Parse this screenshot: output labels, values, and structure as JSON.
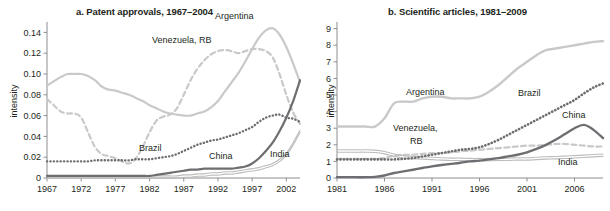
{
  "figure": {
    "background": "#ffffff",
    "text_color": "#231f20"
  },
  "colors": {
    "argentina": "#c9c9c9",
    "venezuela": "#c9c9c9",
    "brazil": "#6d6e71",
    "china": "#6d6e71",
    "india": "#bcbcbc",
    "axis": "#808285"
  },
  "panel_a": {
    "title": "a. Patent approvals, 1967–2004",
    "ylabel": "intensity",
    "ytick_labels": [
      "0",
      "0.02",
      "0.04",
      "0.06",
      "0.08",
      "0.10",
      "0.12",
      "0.14"
    ],
    "xtick_labels": [
      "1967",
      "1972",
      "1977",
      "1982",
      "1987",
      "1992",
      "1997",
      "2002"
    ],
    "series_labels": {
      "argentina": "Argentina",
      "venezuela": "Venezuela, RB",
      "brazil": "Brazil",
      "china": "China",
      "india": "India"
    }
  },
  "panel_b": {
    "title": "b. Scientific articles, 1981–2009",
    "ylabel": "intensity",
    "ytick_labels": [
      "0",
      "1",
      "2",
      "3",
      "4",
      "5",
      "6",
      "7",
      "8",
      "9"
    ],
    "xtick_labels": [
      "1981",
      "1986",
      "1991",
      "1996",
      "2001",
      "2006"
    ],
    "series_labels": {
      "argentina": "Argentina",
      "venezuela_line1": "Venezuela,",
      "venezuela_line2": "RB",
      "brazil": "Brazil",
      "china": "China",
      "india": "India"
    }
  },
  "chart_data": [
    {
      "type": "line",
      "title": "a. Patent approvals, 1967–2004",
      "xlabel": "",
      "ylabel": "intensity",
      "xlim": [
        1967,
        2004
      ],
      "ylim": [
        0,
        0.15
      ],
      "yticks": [
        0,
        0.02,
        0.04,
        0.06,
        0.08,
        0.1,
        0.12,
        0.14
      ],
      "xticks": [
        1967,
        1972,
        1977,
        1982,
        1987,
        1992,
        1997,
        2002
      ],
      "grid": false,
      "legend": "inline-annotations",
      "x": [
        1967,
        1968,
        1969,
        1970,
        1971,
        1972,
        1973,
        1974,
        1975,
        1976,
        1977,
        1978,
        1979,
        1980,
        1981,
        1982,
        1983,
        1984,
        1985,
        1986,
        1987,
        1988,
        1989,
        1990,
        1991,
        1992,
        1993,
        1994,
        1995,
        1996,
        1997,
        1998,
        1999,
        2000,
        2001,
        2002,
        2003,
        2004
      ],
      "series": [
        {
          "name": "Argentina",
          "style": "solid",
          "color": "#c9c9c9",
          "width": 2.2,
          "values": [
            0.089,
            0.093,
            0.097,
            0.1,
            0.1,
            0.1,
            0.098,
            0.094,
            0.088,
            0.085,
            0.084,
            0.082,
            0.08,
            0.077,
            0.074,
            0.07,
            0.067,
            0.064,
            0.062,
            0.061,
            0.06,
            0.06,
            0.062,
            0.064,
            0.068,
            0.074,
            0.083,
            0.092,
            0.101,
            0.112,
            0.124,
            0.135,
            0.142,
            0.144,
            0.138,
            0.126,
            0.11,
            0.092
          ]
        },
        {
          "name": "Venezuela, RB",
          "style": "dashed",
          "color": "#c9c9c9",
          "width": 2.2,
          "values": [
            0.076,
            0.07,
            0.064,
            0.062,
            0.062,
            0.058,
            0.044,
            0.03,
            0.023,
            0.021,
            0.019,
            0.016,
            0.014,
            0.019,
            0.03,
            0.044,
            0.055,
            0.059,
            0.061,
            0.067,
            0.08,
            0.094,
            0.105,
            0.113,
            0.119,
            0.122,
            0.123,
            0.122,
            0.12,
            0.122,
            0.124,
            0.124,
            0.122,
            0.116,
            0.1,
            0.08,
            0.063,
            0.052
          ]
        },
        {
          "name": "Brazil",
          "style": "dotted",
          "color": "#6d6e71",
          "width": 2.4,
          "values": [
            0.016,
            0.016,
            0.016,
            0.016,
            0.016,
            0.016,
            0.016,
            0.017,
            0.017,
            0.017,
            0.017,
            0.017,
            0.017,
            0.018,
            0.018,
            0.018,
            0.019,
            0.02,
            0.021,
            0.023,
            0.026,
            0.029,
            0.032,
            0.034,
            0.036,
            0.037,
            0.039,
            0.041,
            0.043,
            0.046,
            0.049,
            0.054,
            0.058,
            0.06,
            0.061,
            0.058,
            0.057,
            0.054
          ]
        },
        {
          "name": "China",
          "style": "solid",
          "color": "#6d6e71",
          "width": 2.2,
          "values": [
            0.002,
            0.002,
            0.002,
            0.002,
            0.002,
            0.002,
            0.002,
            0.002,
            0.002,
            0.002,
            0.002,
            0.002,
            0.002,
            0.002,
            0.002,
            0.002,
            0.003,
            0.004,
            0.005,
            0.006,
            0.007,
            0.008,
            0.008,
            0.009,
            0.009,
            0.009,
            0.009,
            0.009,
            0.01,
            0.011,
            0.014,
            0.019,
            0.026,
            0.034,
            0.045,
            0.058,
            0.074,
            0.094
          ]
        },
        {
          "name": "India",
          "style": "solid-thin-double",
          "color": "#bcbcbc",
          "width": 1.1,
          "values": [
            0.002,
            0.002,
            0.002,
            0.002,
            0.002,
            0.002,
            0.002,
            0.002,
            0.002,
            0.002,
            0.002,
            0.002,
            0.002,
            0.002,
            0.002,
            0.002,
            0.002,
            0.002,
            0.002,
            0.002,
            0.003,
            0.003,
            0.004,
            0.004,
            0.005,
            0.005,
            0.006,
            0.006,
            0.007,
            0.008,
            0.009,
            0.01,
            0.012,
            0.014,
            0.018,
            0.024,
            0.034,
            0.046
          ]
        }
      ]
    },
    {
      "type": "line",
      "title": "b. Scientific articles, 1981–2009",
      "xlabel": "",
      "ylabel": "intensity",
      "xlim": [
        1981,
        2009
      ],
      "ylim": [
        0,
        9.4
      ],
      "yticks": [
        0,
        1,
        2,
        3,
        4,
        5,
        6,
        7,
        8,
        9
      ],
      "xticks": [
        1981,
        1986,
        1991,
        1996,
        2001,
        2006
      ],
      "grid": false,
      "legend": "inline-annotations",
      "x": [
        1981,
        1982,
        1983,
        1984,
        1985,
        1986,
        1987,
        1988,
        1989,
        1990,
        1991,
        1992,
        1993,
        1994,
        1995,
        1996,
        1997,
        1998,
        1999,
        2000,
        2001,
        2002,
        2003,
        2004,
        2005,
        2006,
        2007,
        2008,
        2009
      ],
      "series": [
        {
          "name": "Argentina",
          "style": "solid",
          "color": "#c9c9c9",
          "width": 2.4,
          "values": [
            3.1,
            3.1,
            3.1,
            3.1,
            3.1,
            3.6,
            4.5,
            4.6,
            4.6,
            4.8,
            4.9,
            4.9,
            4.8,
            4.8,
            4.8,
            4.9,
            5.2,
            5.6,
            6.1,
            6.6,
            7.0,
            7.4,
            7.7,
            7.8,
            7.9,
            8.0,
            8.1,
            8.2,
            8.25
          ]
        },
        {
          "name": "Venezuela, RB",
          "style": "dashed",
          "color": "#c9c9c9",
          "width": 2.2,
          "values": [
            1.15,
            1.15,
            1.15,
            1.15,
            1.15,
            1.2,
            1.35,
            1.4,
            1.4,
            1.45,
            1.5,
            1.5,
            1.55,
            1.6,
            1.65,
            1.7,
            1.75,
            1.8,
            1.85,
            1.9,
            1.95,
            1.95,
            2.0,
            2.05,
            2.05,
            2.0,
            1.95,
            1.9,
            1.9
          ]
        },
        {
          "name": "Brazil",
          "style": "dotted",
          "color": "#6d6e71",
          "width": 2.6,
          "values": [
            1.12,
            1.12,
            1.12,
            1.12,
            1.12,
            1.12,
            1.12,
            1.15,
            1.2,
            1.3,
            1.4,
            1.5,
            1.6,
            1.7,
            1.75,
            1.85,
            2.05,
            2.3,
            2.6,
            2.9,
            3.2,
            3.5,
            3.8,
            4.1,
            4.4,
            4.7,
            5.1,
            5.45,
            5.7
          ]
        },
        {
          "name": "China",
          "style": "solid",
          "color": "#6d6e71",
          "width": 2.4,
          "values": [
            0.05,
            0.05,
            0.05,
            0.05,
            0.07,
            0.15,
            0.3,
            0.4,
            0.5,
            0.6,
            0.7,
            0.78,
            0.85,
            0.92,
            1.0,
            1.05,
            1.12,
            1.2,
            1.3,
            1.4,
            1.55,
            1.75,
            2.0,
            2.3,
            2.65,
            3.0,
            3.2,
            2.9,
            2.4
          ]
        },
        {
          "name": "India",
          "style": "solid-thin-double",
          "color": "#bcbcbc",
          "width": 1.1,
          "values": [
            1.7,
            1.7,
            1.7,
            1.7,
            1.68,
            1.6,
            1.45,
            1.35,
            1.3,
            1.28,
            1.25,
            1.22,
            1.2,
            1.2,
            1.18,
            1.18,
            1.18,
            1.2,
            1.2,
            1.22,
            1.22,
            1.25,
            1.28,
            1.3,
            1.32,
            1.35,
            1.38,
            1.42,
            1.45
          ]
        }
      ]
    }
  ],
  "annotations_a": [
    {
      "name": "argentina-label",
      "text": "Argentina",
      "x": 215,
      "y": 19,
      "color": "#808285"
    },
    {
      "name": "venezuela-label",
      "text": "Venezuela, RB",
      "x": 152,
      "y": 43,
      "color": "#808285"
    },
    {
      "name": "brazil-label",
      "text": "Brazil",
      "x": 139,
      "y": 151,
      "color": "#6d6e71"
    },
    {
      "name": "china-label",
      "text": "China",
      "x": 209,
      "y": 159,
      "color": "#6d6e71"
    },
    {
      "name": "india-label",
      "text": "India",
      "x": 270,
      "y": 157,
      "color": "#808285"
    }
  ],
  "annotations_b": [
    {
      "name": "argentina-label",
      "text": "Argentina",
      "x": 101,
      "y": 95,
      "color": "#808285"
    },
    {
      "name": "venezuela-label-line1",
      "text": "Venezuela,",
      "x": 88,
      "y": 131,
      "color": "#808285"
    },
    {
      "name": "venezuela-label-line2",
      "text": "RB",
      "x": 105,
      "y": 144,
      "color": "#808285"
    },
    {
      "name": "brazil-label",
      "text": "Brazil",
      "x": 213,
      "y": 96,
      "color": "#6d6e71"
    },
    {
      "name": "china-label",
      "text": "China",
      "x": 257,
      "y": 118,
      "color": "#6d6e71"
    },
    {
      "name": "india-label",
      "text": "India",
      "x": 253,
      "y": 165,
      "color": "#808285"
    }
  ]
}
